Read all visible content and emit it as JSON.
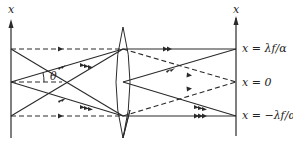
{
  "diagram": {
    "left_axis_label": "x",
    "right_axis_label": "x",
    "angle_label": "θ",
    "plane_labels": [
      {
        "id": "top",
        "text": "x = λf/α"
      },
      {
        "id": "center",
        "text": "x = 0"
      },
      {
        "id": "bottom",
        "text": "x = −λf/α"
      }
    ],
    "elements": {
      "lens": "converging-lens",
      "left_plane": "input-plane",
      "right_plane": "focal-plane"
    },
    "colors": {
      "stroke": "#2a2a2a",
      "background": "#ffffff"
    }
  }
}
